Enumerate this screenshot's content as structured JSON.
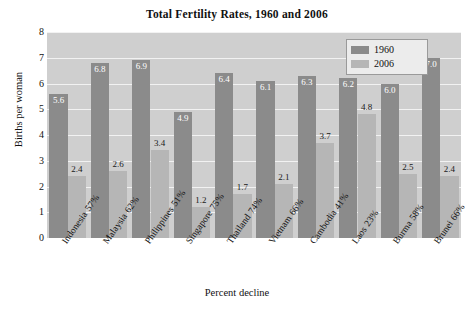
{
  "chart_data": {
    "type": "bar",
    "title": "Total Fertility Rates, 1960 and 2006",
    "xlabel": "Percent decline",
    "ylabel": "Births per woman",
    "ylim": [
      0,
      8
    ],
    "ytick_labels": [
      "8",
      "7",
      "6",
      "5",
      "4",
      "3",
      "2",
      "1",
      "0"
    ],
    "yticks": [
      8,
      7,
      6,
      5,
      4,
      3,
      2,
      1,
      0
    ],
    "grid": true,
    "legend_position": "top-right",
    "categories": [
      "Indonesia",
      "Malaysia",
      "Philippines",
      "Singapore",
      "Thailand",
      "Vietnam",
      "Cambodia",
      "Laos",
      "Burma",
      "Brunei"
    ],
    "category_sublabels": [
      "57%",
      "62%",
      "51%",
      "75%",
      "74%",
      "66%",
      "41%",
      "23%",
      "58%",
      "66%"
    ],
    "series": [
      {
        "name": "1960",
        "color": "#8b8b8b",
        "values": [
          5.6,
          6.8,
          6.9,
          4.9,
          6.4,
          6.1,
          6.3,
          6.2,
          6.0,
          7.0
        ],
        "value_labels": [
          "5.6",
          "6.8",
          "6.9",
          "4.9",
          "6.4",
          "6.1",
          "6.3",
          "6.2",
          "6.0",
          "7.0"
        ]
      },
      {
        "name": "2006",
        "color": "#b6b6b6",
        "values": [
          2.4,
          2.6,
          3.4,
          1.2,
          1.7,
          2.1,
          3.7,
          4.8,
          2.5,
          2.4
        ],
        "value_labels": [
          "2.4",
          "2.6",
          "3.4",
          "1.2",
          "1.7",
          "2.1",
          "3.7",
          "4.8",
          "2.5",
          "2.4"
        ]
      }
    ],
    "colors": {
      "plot_background": "#cfcfcf",
      "gridline": "#f2f2f2",
      "series_1960": "#8b8b8b",
      "series_2006": "#b6b6b6",
      "text": "#111111",
      "legend_background": "#ececec"
    }
  }
}
